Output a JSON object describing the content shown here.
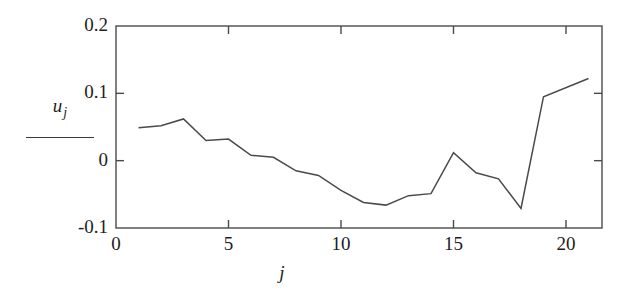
{
  "chart_data": {
    "type": "line",
    "title": "",
    "xlabel": "j",
    "ylabel": "u_j",
    "xlim": [
      0,
      21.6
    ],
    "ylim": [
      -0.1,
      0.2
    ],
    "grid": false,
    "legend": null,
    "x_ticks": [
      0,
      5,
      10,
      15,
      20
    ],
    "x_tick_labels": [
      "0",
      "5",
      "10",
      "15",
      "20"
    ],
    "y_ticks": [
      -0.1,
      0,
      0.1,
      0.2
    ],
    "y_tick_labels": [
      "-0.1",
      "0",
      "0.1",
      "0.2"
    ],
    "series": [
      {
        "name": "u_j",
        "color": "#4a4a4a",
        "x": [
          1,
          2,
          3,
          4,
          5,
          6,
          7,
          8,
          9,
          10,
          11,
          12,
          13,
          14,
          15,
          16,
          17,
          18,
          19,
          21
        ],
        "values": [
          0.049,
          0.052,
          0.062,
          0.03,
          0.032,
          0.008,
          0.005,
          -0.015,
          -0.022,
          -0.044,
          -0.062,
          -0.066,
          -0.052,
          -0.049,
          0.012,
          -0.018,
          -0.027,
          -0.071,
          0.095,
          0.122
        ]
      }
    ]
  },
  "axes": {
    "y_label_main": "u",
    "y_label_sub": "j",
    "x_label": "j"
  }
}
